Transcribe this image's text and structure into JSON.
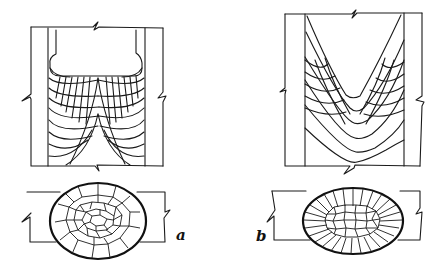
{
  "figure": {
    "panels": [
      {
        "id": "a",
        "label": "a",
        "description": "Longitudinal section showing columnar grains curving from fusion boundary toward centerline, with flat-topped pool; cross-section shows equiaxed central grains",
        "longitudinal": {
          "type": "u-shaped-pool",
          "grain_lines": 8
        },
        "cross_section": {
          "type": "ellipse",
          "structure": "equiaxed-cells"
        }
      },
      {
        "id": "b",
        "label": "b",
        "description": "Longitudinal section showing V-shaped pool with intersecting grain arcs; cross-section shows radial columnar grains surrounding small equiaxed core",
        "longitudinal": {
          "type": "v-shaped-pool",
          "grain_lines": 6
        },
        "cross_section": {
          "type": "ellipse",
          "structure": "radial-columnar-with-equiaxed-core"
        }
      }
    ],
    "colors": {
      "ink": "#1a1a1a",
      "background": "#ffffff"
    }
  }
}
